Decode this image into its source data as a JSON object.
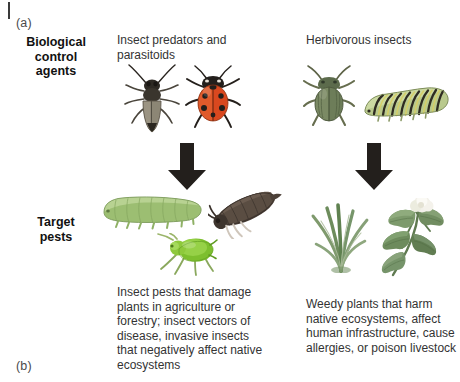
{
  "figure": {
    "panel_a_label": "(a)",
    "panel_b_label": "(b)"
  },
  "rows": {
    "agents_label": "Biological\ncontrol\nagents",
    "agents_label_line1": "Biological",
    "agents_label_line2": "control",
    "agents_label_line3": "agents",
    "pests_label_line1": "Target",
    "pests_label_line2": "pests"
  },
  "columns": {
    "left": {
      "header": "Insect predators and parasitoids",
      "caption": "Insect pests that damage plants in agriculture or forestry; insect vectors of disease, invasive insects that negatively affect native ecosystems",
      "agents": [
        {
          "name": "ground-beetle-illustration",
          "common": "dark predatory beetle",
          "color": "#6d6a5e"
        },
        {
          "name": "ladybug-illustration",
          "common": "ladybird beetle",
          "color": "#d9481f"
        }
      ],
      "pests": [
        {
          "name": "caterpillar-illustration",
          "common": "green caterpillar",
          "color": "#a8c97f"
        },
        {
          "name": "moth-illustration",
          "common": "brown moth",
          "color": "#55483f"
        },
        {
          "name": "aphid-illustration",
          "common": "green aphid",
          "color": "#8dc63f"
        }
      ]
    },
    "right": {
      "header": "Herbivorous insects",
      "caption": "Weedy plants that harm native ecosystems, affect human infrastructure, cause allergies, or poison livestock",
      "agents": [
        {
          "name": "leaf-beetle-illustration",
          "common": "green leaf beetle",
          "color": "#5f7052"
        },
        {
          "name": "swallowtail-caterpillar-illustration",
          "common": "banded swallowtail caterpillar",
          "color": "#9fb06a"
        }
      ],
      "pests": [
        {
          "name": "grass-weed-illustration",
          "common": "grass tuft",
          "color": "#7d9b6c"
        },
        {
          "name": "broadleaf-weed-illustration",
          "common": "thistle-like broadleaf weed",
          "color": "#6f8b63"
        }
      ]
    }
  },
  "arrows": {
    "left_label": "downward arrow from biological control agents to target pests",
    "right_label": "downward arrow from biological control agents to target pests",
    "color": "#231f1c"
  },
  "colors": {
    "background": "#ffffff",
    "text": "#333333",
    "label_text": "#111111",
    "arrow": "#231f1c"
  }
}
